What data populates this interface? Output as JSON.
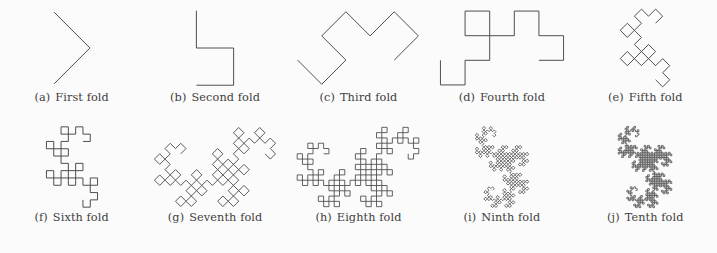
{
  "figure": {
    "background_color": "#fbfbfb",
    "stroke_color": "#3c3c3c",
    "caption_color": "#3e3e3e",
    "panels": [
      {
        "tag": "(a)",
        "label": "First fold",
        "name": "panel-first-fold",
        "order": 1,
        "iteration": 1,
        "segments": 2,
        "base_angle_deg": 45,
        "step": 26,
        "stroke_width": 0.9
      },
      {
        "tag": "(b)",
        "label": "Second fold",
        "name": "panel-second-fold",
        "order": 2,
        "iteration": 2,
        "segments": 4,
        "base_angle_deg": 0,
        "step": 26,
        "stroke_width": 0.9
      },
      {
        "tag": "(c)",
        "label": "Third fold",
        "name": "panel-third-fold",
        "order": 3,
        "iteration": 3,
        "segments": 8,
        "base_angle_deg": 45,
        "step": 19,
        "stroke_width": 0.9
      },
      {
        "tag": "(d)",
        "label": "Fourth fold",
        "name": "panel-fourth-fold",
        "order": 4,
        "iteration": 4,
        "segments": 16,
        "base_angle_deg": 0,
        "step": 16,
        "stroke_width": 0.9
      },
      {
        "tag": "(e)",
        "label": "Fifth fold",
        "name": "panel-fifth-fold",
        "order": 5,
        "iteration": 5,
        "segments": 32,
        "base_angle_deg": 45,
        "step": 12.5,
        "stroke_width": 0.9
      },
      {
        "tag": "(f)",
        "label": "Sixth fold",
        "name": "panel-sixth-fold",
        "order": 6,
        "iteration": 6,
        "segments": 64,
        "base_angle_deg": 0,
        "step": 10.5,
        "stroke_width": 0.9
      },
      {
        "tag": "(g)",
        "label": "Seventh fold",
        "name": "panel-seventh-fold",
        "order": 7,
        "iteration": 7,
        "segments": 128,
        "base_angle_deg": 45,
        "step": 7.6,
        "stroke_width": 0.85
      },
      {
        "tag": "(h)",
        "label": "Eighth fold",
        "name": "panel-eighth-fold",
        "order": 8,
        "iteration": 8,
        "segments": 256,
        "base_angle_deg": 0,
        "step": 5.6,
        "stroke_width": 0.8
      },
      {
        "tag": "(i)",
        "label": "Ninth fold",
        "name": "panel-ninth-fold",
        "order": 9,
        "iteration": 9,
        "segments": 512,
        "base_angle_deg": 45,
        "step": 4.0,
        "stroke_width": 0.75
      },
      {
        "tag": "(j)",
        "label": "Tenth fold",
        "name": "panel-tenth-fold",
        "order": 10,
        "iteration": 10,
        "segments": 1024,
        "base_angle_deg": 0,
        "step": 2.9,
        "stroke_width": 0.7
      }
    ]
  }
}
